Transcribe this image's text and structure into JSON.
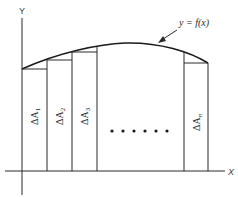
{
  "diagram": {
    "axes": {
      "y_label": "Y",
      "x_label": "X"
    },
    "function_label": "y = f(x)",
    "area_labels": [
      "ΔA",
      "ΔA",
      "ΔA",
      "ΔA"
    ],
    "area_subscripts": [
      "1",
      "2",
      "3",
      "n"
    ],
    "ellipsis": "• • • • • •",
    "colors": {
      "stroke": "#2a2a2a",
      "background": "#ffffff"
    }
  }
}
